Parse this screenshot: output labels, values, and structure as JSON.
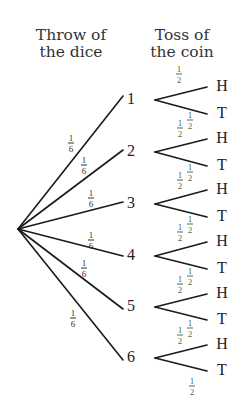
{
  "headers": {
    "dice": [
      "Throw of",
      "the dice"
    ],
    "coin": [
      "Toss of",
      "the coin"
    ]
  },
  "root": {
    "x": 18,
    "y": 229
  },
  "dice": [
    {
      "label": "1",
      "x": 131,
      "y": 99,
      "end": [
        123,
        96
      ],
      "prob": {
        "n": "1",
        "d": "6",
        "x": 71,
        "y": 143
      }
    },
    {
      "label": "2",
      "x": 131,
      "y": 151,
      "end": [
        123,
        150
      ],
      "prob": {
        "n": "1",
        "d": "6",
        "x": 84,
        "y": 165
      }
    },
    {
      "label": "3",
      "x": 131,
      "y": 203,
      "end": [
        123,
        202
      ],
      "prob": {
        "n": "1",
        "d": "6",
        "x": 91,
        "y": 198
      }
    },
    {
      "label": "4",
      "x": 131,
      "y": 255,
      "end": [
        123,
        256
      ],
      "prob": {
        "n": "1",
        "d": "6",
        "x": 91,
        "y": 240
      }
    },
    {
      "label": "5",
      "x": 131,
      "y": 306,
      "end": [
        123,
        309
      ],
      "prob": {
        "n": "1",
        "d": "6",
        "x": 84,
        "y": 268
      }
    },
    {
      "label": "6",
      "x": 131,
      "y": 357,
      "end": [
        123,
        360
      ],
      "prob": {
        "n": "1",
        "d": "6",
        "x": 73,
        "y": 318
      }
    }
  ],
  "coin_branches": [
    {
      "y": 100,
      "H": {
        "label": "H",
        "y": 86
      },
      "T": {
        "label": "T",
        "y": 113
      },
      "pH": {
        "n": "1",
        "d": "2",
        "x": 179,
        "y": 74
      },
      "pT": {
        "n": "1",
        "d": "2",
        "x": 190,
        "y": 120
      }
    },
    {
      "y": 152,
      "H": {
        "label": "H",
        "y": 138
      },
      "T": {
        "label": "T",
        "y": 165
      },
      "pH": {
        "n": "1",
        "d": "2",
        "x": 180,
        "y": 128
      },
      "pT": {
        "n": "1",
        "d": "2",
        "x": 190,
        "y": 172
      }
    },
    {
      "y": 204,
      "H": {
        "label": "H",
        "y": 189
      },
      "T": {
        "label": "T",
        "y": 216
      },
      "pH": {
        "n": "1",
        "d": "2",
        "x": 180,
        "y": 180
      },
      "pT": {
        "n": "1",
        "d": "2",
        "x": 190,
        "y": 224
      }
    },
    {
      "y": 256,
      "H": {
        "label": "H",
        "y": 241
      },
      "T": {
        "label": "T",
        "y": 268
      },
      "pH": {
        "n": "1",
        "d": "2",
        "x": 180,
        "y": 232
      },
      "pT": {
        "n": "1",
        "d": "2",
        "x": 190,
        "y": 276
      }
    },
    {
      "y": 307,
      "H": {
        "label": "H",
        "y": 293
      },
      "T": {
        "label": "T",
        "y": 319
      },
      "pH": {
        "n": "1",
        "d": "2",
        "x": 180,
        "y": 284
      },
      "pT": {
        "n": "1",
        "d": "2",
        "x": 190,
        "y": 328
      }
    },
    {
      "y": 358,
      "H": {
        "label": "H",
        "y": 344
      },
      "T": {
        "label": "T",
        "y": 370
      },
      "pH": {
        "n": "1",
        "d": "2",
        "x": 180,
        "y": 335
      },
      "pT": {
        "n": "1",
        "d": "2",
        "x": 192,
        "y": 386
      }
    }
  ],
  "colors": {
    "line": "#1a1a1a",
    "text": "#222222",
    "fraction_green": "#4a6e4a"
  }
}
